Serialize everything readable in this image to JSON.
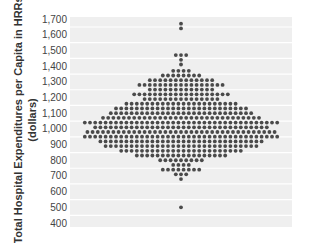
{
  "chart_data": {
    "type": "scatter",
    "subtype": "dot-plot (beeswarm)",
    "title": "",
    "xlabel": "",
    "ylabel_lines": [
      "Total Hospital Expenditures per Capita in HRRs",
      "(dollars)"
    ],
    "ylim": [
      400,
      1700
    ],
    "yticks": [
      400,
      500,
      600,
      700,
      800,
      900,
      1000,
      1100,
      1200,
      1300,
      1400,
      1500,
      1600,
      1700
    ],
    "ytick_labels": [
      "400",
      "500",
      "600",
      "700",
      "800",
      "900",
      "1,000",
      "1,100",
      "1,200",
      "1,300",
      "1,400",
      "1,500",
      "1,600",
      "1,700"
    ],
    "grid": true,
    "legend": null,
    "colors": {
      "plot_bg": "#efefef",
      "grid": "#ffffff",
      "dot": "#4a4a4a",
      "text": "#444444"
    },
    "rows": [
      {
        "value": 1670,
        "count": 1
      },
      {
        "value": 1640,
        "count": 1
      },
      {
        "value": 1470,
        "count": 3
      },
      {
        "value": 1440,
        "count": 1
      },
      {
        "value": 1410,
        "count": 1
      },
      {
        "value": 1370,
        "count": 4
      },
      {
        "value": 1340,
        "count": 8
      },
      {
        "value": 1310,
        "count": 13
      },
      {
        "value": 1280,
        "count": 17
      },
      {
        "value": 1250,
        "count": 13
      },
      {
        "value": 1220,
        "count": 19
      },
      {
        "value": 1190,
        "count": 15
      },
      {
        "value": 1160,
        "count": 22
      },
      {
        "value": 1130,
        "count": 26
      },
      {
        "value": 1100,
        "count": 28
      },
      {
        "value": 1070,
        "count": 31
      },
      {
        "value": 1040,
        "count": 38
      },
      {
        "value": 1010,
        "count": 34
      },
      {
        "value": 980,
        "count": 37
      },
      {
        "value": 950,
        "count": 38
      },
      {
        "value": 920,
        "count": 32
      },
      {
        "value": 890,
        "count": 30
      },
      {
        "value": 860,
        "count": 24
      },
      {
        "value": 830,
        "count": 18
      },
      {
        "value": 800,
        "count": 9
      },
      {
        "value": 770,
        "count": 4
      },
      {
        "value": 740,
        "count": 8
      },
      {
        "value": 710,
        "count": 3
      },
      {
        "value": 680,
        "count": 1
      },
      {
        "value": 500,
        "count": 1
      }
    ]
  }
}
